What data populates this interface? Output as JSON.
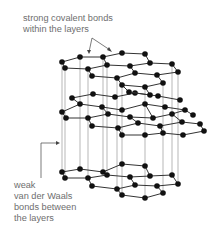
{
  "diagram": {
    "labels": {
      "covalent": [
        "strong covalent bonds",
        "within the layers"
      ],
      "van_der_waals": [
        "weak",
        "van der Waals",
        "bonds between",
        "the layers"
      ]
    },
    "colors": {
      "atom": "#111111",
      "bond": "#333333",
      "interlayer": "#888888",
      "text": "#6e6e6e"
    },
    "layer_count": 3
  }
}
